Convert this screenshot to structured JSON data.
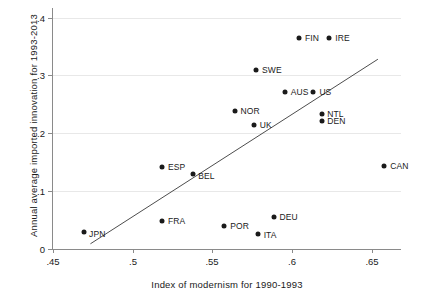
{
  "chart_data": {
    "type": "scatter",
    "title": "",
    "xlabel": "Index of modernism for 1990-1993",
    "ylabel": "Annual average imported innovation for 1993-2013",
    "xlim": [
      0.45,
      0.6685
    ],
    "ylim": [
      0.0,
      0.4165
    ],
    "xticks": [
      ".45",
      ".5",
      ".55",
      ".6",
      ".65"
    ],
    "xtick_values": [
      0.45,
      0.5,
      0.55,
      0.6,
      0.65
    ],
    "yticks": [
      "0",
      ".1",
      ".2",
      ".3",
      ".4"
    ],
    "ytick_values": [
      0.0,
      0.1,
      0.2,
      0.3,
      0.4
    ],
    "grid": "horizontal",
    "legend": "none",
    "points": [
      {
        "label": "FIN",
        "x": 0.6045,
        "y": 0.3655,
        "lx": 6,
        "ly": 0
      },
      {
        "label": "IRE",
        "x": 0.6235,
        "y": 0.3655,
        "lx": 6,
        "ly": 0
      },
      {
        "label": "SWE",
        "x": 0.5775,
        "y": 0.3085,
        "lx": 6,
        "ly": 0
      },
      {
        "label": "AUS",
        "x": 0.5955,
        "y": 0.272,
        "lx": 6,
        "ly": 0
      },
      {
        "label": "US",
        "x": 0.6135,
        "y": 0.272,
        "lx": 6,
        "ly": 0
      },
      {
        "label": "NOR",
        "x": 0.564,
        "y": 0.238,
        "lx": 6,
        "ly": 0
      },
      {
        "label": "UK",
        "x": 0.576,
        "y": 0.214,
        "lx": 6,
        "ly": 0
      },
      {
        "label": "NTL",
        "x": 0.619,
        "y": 0.2325,
        "lx": 5,
        "ly": 0
      },
      {
        "label": "DEN",
        "x": 0.619,
        "y": 0.221,
        "lx": 5,
        "ly": 0
      },
      {
        "label": "CAN",
        "x": 0.658,
        "y": 0.1435,
        "lx": 6,
        "ly": 0
      },
      {
        "label": "ESP",
        "x": 0.5185,
        "y": 0.142,
        "lx": 6,
        "ly": 0
      },
      {
        "label": "BEL",
        "x": 0.538,
        "y": 0.129,
        "lx": 5,
        "ly": 2
      },
      {
        "label": "DEU",
        "x": 0.5885,
        "y": 0.0545,
        "lx": 6,
        "ly": 0
      },
      {
        "label": "FRA",
        "x": 0.5185,
        "y": 0.049,
        "lx": 6,
        "ly": 0
      },
      {
        "label": "POR",
        "x": 0.5575,
        "y": 0.0405,
        "lx": 6,
        "ly": 0
      },
      {
        "label": "ITA",
        "x": 0.5785,
        "y": 0.0255,
        "lx": 6,
        "ly": 1
      },
      {
        "label": "JPN",
        "x": 0.4695,
        "y": 0.03,
        "lx": 5,
        "ly": 2
      }
    ],
    "fit_line": {
      "x1": 0.4735,
      "y1": 0.009,
      "x2": 0.654,
      "y2": 0.328,
      "color": "#4d4d4d"
    }
  },
  "colors": {
    "marker": "#1a1a1a",
    "axis": "#8a8a8a",
    "grid": "#e8e8e8",
    "text": "#1a1a1a",
    "background": "#ffffff"
  }
}
